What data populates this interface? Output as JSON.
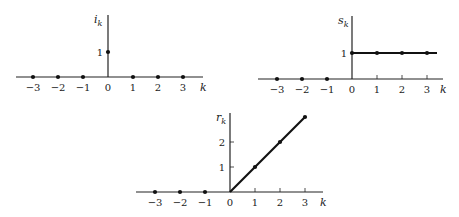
{
  "chart_data": [
    {
      "type": "scatter",
      "name": "unit-impulse",
      "title": "",
      "xlabel": "k",
      "ylabel": "i_k",
      "ylabel_main": "i",
      "ylabel_sub": "k",
      "x": [
        -3,
        -2,
        -1,
        0,
        1,
        2,
        3
      ],
      "values": [
        0,
        0,
        0,
        1,
        0,
        0,
        0
      ],
      "x_ticks": [
        "−3",
        "−2",
        "−1",
        "0",
        "1",
        "2",
        "3"
      ],
      "y_ticks": [
        "1"
      ],
      "grid": false,
      "legend": null,
      "style": "stem"
    },
    {
      "type": "line",
      "name": "unit-step",
      "title": "",
      "xlabel": "k",
      "ylabel": "s_k",
      "ylabel_main": "s",
      "ylabel_sub": "k",
      "x": [
        -3,
        -2,
        -1,
        0,
        1,
        2,
        3
      ],
      "values": [
        0,
        0,
        0,
        1,
        1,
        1,
        1
      ],
      "x_ticks": [
        "−3",
        "−2",
        "−1",
        "0",
        "1",
        "2",
        "3"
      ],
      "y_ticks": [
        "1"
      ],
      "grid": false,
      "legend": null,
      "style": "points with heavy line for k ≥ 0"
    },
    {
      "type": "line",
      "name": "unit-ramp",
      "title": "",
      "xlabel": "k",
      "ylabel": "r_k",
      "ylabel_main": "r",
      "ylabel_sub": "k",
      "x": [
        -3,
        -2,
        -1,
        0,
        1,
        2,
        3
      ],
      "values": [
        0,
        0,
        0,
        0,
        1,
        2,
        3
      ],
      "x_ticks": [
        "−3",
        "−2",
        "−1",
        "0",
        "1",
        "2",
        "3"
      ],
      "y_ticks": [
        "1",
        "2"
      ],
      "grid": false,
      "legend": null,
      "style": "points with heavy line for k ≥ 0"
    }
  ]
}
